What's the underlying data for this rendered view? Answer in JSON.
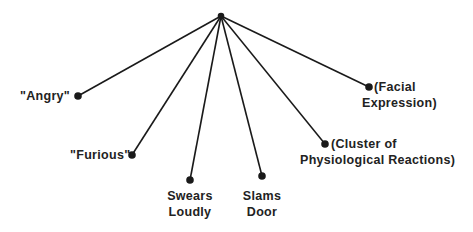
{
  "diagram": {
    "type": "tree",
    "root": {
      "x": 221,
      "y": 16
    },
    "nodes": [
      {
        "id": "angry",
        "lines": [
          "\"Angry\""
        ],
        "x": 78,
        "y": 96
      },
      {
        "id": "furious",
        "lines": [
          "\"Furious\""
        ],
        "x": 132,
        "y": 155
      },
      {
        "id": "swears",
        "lines": [
          "Swears",
          "Loudly"
        ],
        "x": 190,
        "y": 180
      },
      {
        "id": "slams",
        "lines": [
          "Slams",
          "Door"
        ],
        "x": 262,
        "y": 176
      },
      {
        "id": "cluster",
        "lines": [
          "(Cluster of",
          "Physiological Reactions)"
        ],
        "x": 325,
        "y": 144
      },
      {
        "id": "facial",
        "lines": [
          "(Facial",
          "Expression)"
        ],
        "x": 369,
        "y": 87
      }
    ],
    "colors": {
      "line": "#1a1a1a",
      "text": "#222222",
      "background": "#ffffff"
    }
  }
}
